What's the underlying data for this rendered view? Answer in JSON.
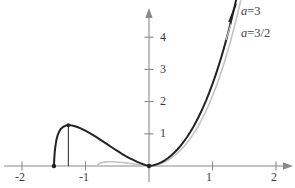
{
  "chart_data": {
    "type": "line",
    "title": "",
    "xlabel": "",
    "ylabel": "",
    "xlim": [
      -2.35,
      2.3
    ],
    "ylim": [
      -0.35,
      5.5
    ],
    "grid": false,
    "legend_position": "top-right",
    "x_ticks": [
      {
        "value": -2,
        "label": "-2"
      },
      {
        "value": -1,
        "label": "-1"
      },
      {
        "value": 1,
        "label": "1"
      },
      {
        "value": 2,
        "label": "2"
      }
    ],
    "y_ticks": [
      {
        "value": 1,
        "label": "1"
      },
      {
        "value": 2,
        "label": "2"
      },
      {
        "value": 3,
        "label": "3"
      },
      {
        "value": 4,
        "label": "4"
      }
    ],
    "series": [
      {
        "name": "a = 3",
        "color": "#232323",
        "width": 2.0,
        "points_left": [
          [
            -1.497,
            0.0
          ],
          [
            -1.492,
            0.22
          ],
          [
            -1.485,
            0.42
          ],
          [
            -1.475,
            0.6
          ],
          [
            -1.46,
            0.79
          ],
          [
            -1.44,
            0.95
          ],
          [
            -1.415,
            1.07
          ],
          [
            -1.385,
            1.16
          ],
          [
            -1.35,
            1.22
          ],
          [
            -1.31,
            1.255
          ],
          [
            -1.27,
            1.268
          ],
          [
            -1.225,
            1.262
          ],
          [
            -1.18,
            1.243
          ],
          [
            -1.13,
            1.212
          ],
          [
            -1.075,
            1.168
          ],
          [
            -1.02,
            1.116
          ],
          [
            -0.96,
            1.053
          ],
          [
            -0.9,
            0.985
          ],
          [
            -0.84,
            0.912
          ],
          [
            -0.78,
            0.836
          ],
          [
            -0.72,
            0.757
          ],
          [
            -0.66,
            0.678
          ],
          [
            -0.6,
            0.598
          ],
          [
            -0.54,
            0.52
          ],
          [
            -0.48,
            0.444
          ],
          [
            -0.42,
            0.371
          ],
          [
            -0.36,
            0.302
          ],
          [
            -0.3,
            0.238
          ],
          [
            -0.24,
            0.18
          ],
          [
            -0.185,
            0.13
          ],
          [
            -0.135,
            0.088
          ],
          [
            -0.09,
            0.053
          ],
          [
            -0.05,
            0.027
          ],
          [
            -0.02,
            0.009
          ],
          [
            0.0,
            0.0
          ]
        ],
        "points_right": [
          [
            0.0,
            0.0
          ],
          [
            0.05,
            0.012
          ],
          [
            0.1,
            0.037
          ],
          [
            0.15,
            0.073
          ],
          [
            0.2,
            0.12
          ],
          [
            0.25,
            0.178
          ],
          [
            0.3,
            0.247
          ],
          [
            0.35,
            0.327
          ],
          [
            0.4,
            0.418
          ],
          [
            0.45,
            0.52
          ],
          [
            0.5,
            0.635
          ],
          [
            0.55,
            0.762
          ],
          [
            0.6,
            0.902
          ],
          [
            0.65,
            1.055
          ],
          [
            0.7,
            1.222
          ],
          [
            0.75,
            1.403
          ],
          [
            0.8,
            1.6
          ],
          [
            0.85,
            1.812
          ],
          [
            0.9,
            2.04
          ],
          [
            0.95,
            2.286
          ],
          [
            1.0,
            2.55
          ],
          [
            1.05,
            2.832
          ],
          [
            1.1,
            3.134
          ],
          [
            1.15,
            3.456
          ],
          [
            1.2,
            3.8
          ],
          [
            1.25,
            4.166
          ],
          [
            1.3,
            4.556
          ],
          [
            1.35,
            4.97
          ],
          [
            1.38,
            5.23
          ],
          [
            1.4,
            5.41
          ]
        ],
        "endpoint_dots": [
          [
            -1.497,
            0.0
          ],
          [
            0.0,
            0.0
          ]
        ],
        "drop_line": {
          "x": -1.27,
          "y_top": 1.268,
          "y_bottom": 0.0
        }
      },
      {
        "name": "a = 3/2",
        "color": "#c4c4c4",
        "width": 1.6,
        "points_left": [
          [
            -0.815,
            0.0
          ],
          [
            -0.81,
            0.028
          ],
          [
            -0.8,
            0.05
          ],
          [
            -0.785,
            0.072
          ],
          [
            -0.765,
            0.092
          ],
          [
            -0.74,
            0.108
          ],
          [
            -0.71,
            0.12
          ],
          [
            -0.675,
            0.128
          ],
          [
            -0.64,
            0.132
          ],
          [
            -0.6,
            0.133
          ],
          [
            -0.56,
            0.131
          ],
          [
            -0.515,
            0.126
          ],
          [
            -0.47,
            0.118
          ],
          [
            -0.42,
            0.108
          ],
          [
            -0.37,
            0.096
          ],
          [
            -0.32,
            0.083
          ],
          [
            -0.27,
            0.069
          ],
          [
            -0.22,
            0.055
          ],
          [
            -0.175,
            0.042
          ],
          [
            -0.13,
            0.03
          ],
          [
            -0.09,
            0.019
          ],
          [
            -0.055,
            0.011
          ],
          [
            -0.025,
            0.004
          ],
          [
            0.0,
            0.0
          ]
        ],
        "points_right": [
          [
            0.0,
            0.0
          ],
          [
            0.05,
            0.008
          ],
          [
            0.1,
            0.026
          ],
          [
            0.15,
            0.053
          ],
          [
            0.2,
            0.088
          ],
          [
            0.25,
            0.132
          ],
          [
            0.3,
            0.186
          ],
          [
            0.35,
            0.249
          ],
          [
            0.4,
            0.322
          ],
          [
            0.45,
            0.406
          ],
          [
            0.5,
            0.5
          ],
          [
            0.55,
            0.606
          ],
          [
            0.6,
            0.724
          ],
          [
            0.65,
            0.855
          ],
          [
            0.7,
            0.998
          ],
          [
            0.75,
            1.156
          ],
          [
            0.8,
            1.328
          ],
          [
            0.85,
            1.515
          ],
          [
            0.9,
            1.718
          ],
          [
            0.95,
            1.937
          ],
          [
            1.0,
            2.174
          ],
          [
            1.05,
            2.428
          ],
          [
            1.1,
            2.701
          ],
          [
            1.15,
            2.993
          ],
          [
            1.2,
            3.305
          ],
          [
            1.25,
            3.638
          ],
          [
            1.3,
            3.992
          ],
          [
            1.35,
            4.369
          ],
          [
            1.4,
            4.769
          ],
          [
            1.43,
            5.02
          ],
          [
            1.45,
            5.19
          ]
        ]
      }
    ],
    "annotations": [
      {
        "text": "a = 3",
        "series": "a = 3"
      },
      {
        "text": "a = 3/2",
        "series": "a = 3/2"
      }
    ]
  },
  "legend": {
    "items": [
      {
        "var": "a",
        "op": "=",
        "value": "3"
      },
      {
        "var": "a",
        "op": "=",
        "value": "3/2"
      }
    ]
  },
  "axes": {
    "x_tick_labels": [
      "-2",
      "-1",
      "1",
      "2"
    ],
    "y_tick_labels": [
      "1",
      "2",
      "3",
      "4"
    ],
    "axis_color": "#8a8a8a"
  }
}
